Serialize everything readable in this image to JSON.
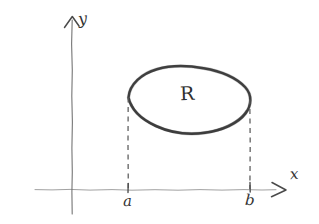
{
  "figure": {
    "kind": "hand-drawn-sketch",
    "background_color": "#ffffff",
    "ink_color": "#343434",
    "axis_color": "#6f6f6f",
    "dash_color": "#5a5a5a"
  },
  "axes": {
    "y_axis": {
      "label": "y",
      "arrow": "caret-up-arrow",
      "x_position_px": 72,
      "top_px": 20,
      "bottom_px": 214
    },
    "x_axis": {
      "label": "x",
      "arrow": "open-right-arrow",
      "y_position_px": 190,
      "left_px": 35,
      "right_px": 276
    },
    "origin": {
      "x_px": 72,
      "y_px": 190
    }
  },
  "region": {
    "label": "R",
    "shape": "irregular-closed-blob",
    "left_extreme_px": {
      "x": 128,
      "y": 97
    },
    "right_extreme_px": {
      "x": 250,
      "y": 99
    },
    "top_px": 66,
    "bottom_px": 133
  },
  "marks": [
    {
      "name": "a",
      "label": "a",
      "x_px": 128,
      "tick": true,
      "dashed_line_from_y_px": 97,
      "dashed_line_to_y_px": 189
    },
    {
      "name": "b",
      "label": "b",
      "x_px": 250,
      "tick": true,
      "dashed_line_from_y_px": 99,
      "dashed_line_to_y_px": 189
    }
  ]
}
